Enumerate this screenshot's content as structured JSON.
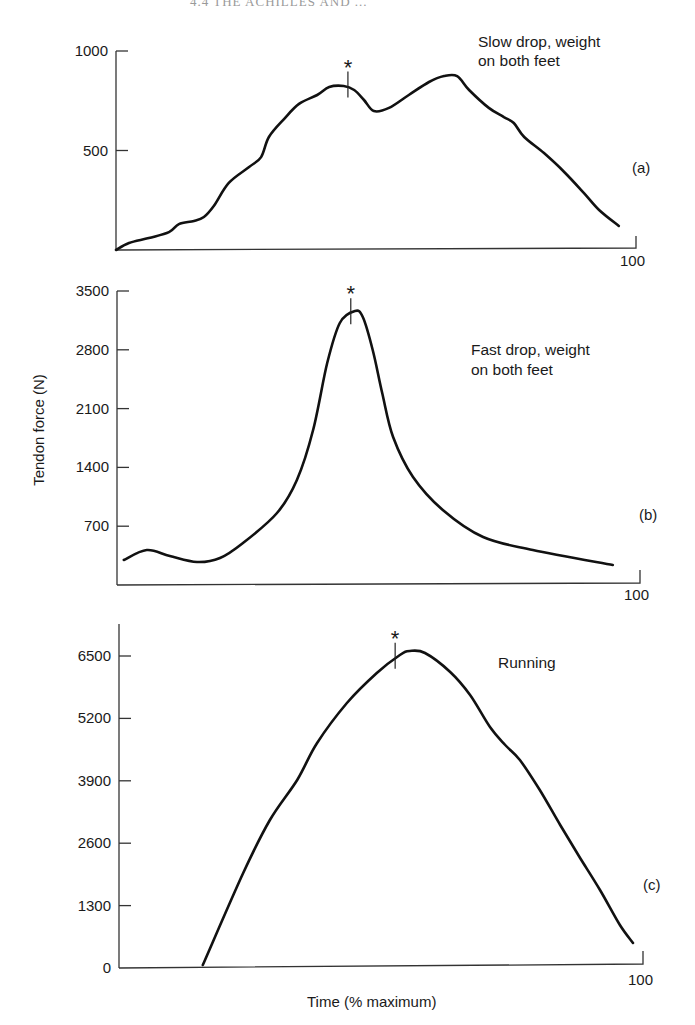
{
  "page_header": "4.4  THE ACHILLES AND ...",
  "chart_data": [
    {
      "id": "a",
      "type": "line",
      "panel_label": "(a)",
      "title_lines": [
        "Slow drop, weight",
        "on both feet"
      ],
      "xlabel": "Time (% maximum)",
      "ylabel": "Tendon force (N)",
      "xlim": [
        0,
        100
      ],
      "ylim": [
        0,
        1000
      ],
      "x_tick_labels": [
        "100"
      ],
      "y_ticks": [
        500,
        1000
      ],
      "y_tick_labels": [
        "500",
        "1000"
      ],
      "grid": false,
      "peak_marker": {
        "symbol": "*",
        "x": 44.6
      },
      "x": [
        0,
        2.5,
        6.3,
        10.2,
        12.1,
        15,
        16.9,
        18.8,
        21.7,
        25.6,
        27.9,
        29.4,
        32.3,
        35.2,
        38.7,
        41,
        43.8,
        45.8,
        47.7,
        49.6,
        52.5,
        56.3,
        60.2,
        63.1,
        65.6,
        67.9,
        71.7,
        74.6,
        76.5,
        78.5,
        82.3,
        86.2,
        90,
        92.9,
        96.7
      ],
      "values": [
        0,
        35,
        60,
        90,
        130,
        146,
        166,
        221,
        337,
        417,
        467,
        568,
        658,
        734,
        779,
        819,
        824,
        804,
        754,
        698,
        714,
        779,
        844,
        874,
        874,
        804,
        714,
        668,
        638,
        568,
        487,
        392,
        286,
        201,
        121
      ]
    },
    {
      "id": "b",
      "type": "line",
      "panel_label": "(b)",
      "title_lines": [
        "Fast drop, weight",
        "on both feet"
      ],
      "xlabel": "Time (% maximum)",
      "ylabel": "Tendon force (N)",
      "xlim": [
        0,
        100
      ],
      "ylim": [
        0,
        3500
      ],
      "x_tick_labels": [
        "100"
      ],
      "y_ticks": [
        700,
        1400,
        2100,
        2800,
        3500
      ],
      "y_tick_labels": [
        "700",
        "1400",
        "2100",
        "2800",
        "3500"
      ],
      "grid": false,
      "peak_marker": {
        "symbol": "*",
        "x": 44.7
      },
      "x": [
        1.3,
        5.7,
        10.1,
        15.3,
        19.7,
        24.1,
        30.6,
        34.4,
        37.5,
        40.2,
        42.6,
        45.5,
        47,
        48.9,
        50.7,
        52.8,
        56.6,
        62.3,
        70,
        79.5,
        94.8
      ],
      "values": [
        298,
        417,
        345,
        274,
        321,
        500,
        857,
        1250,
        1845,
        2643,
        3119,
        3262,
        3190,
        2798,
        2286,
        1762,
        1286,
        893,
        571,
        417,
        238
      ]
    },
    {
      "id": "c",
      "type": "line",
      "panel_label": "(c)",
      "title_lines": [
        "Running"
      ],
      "xlabel": "Time (% maximum)",
      "ylabel": "Tendon force (N)",
      "xlim": [
        0,
        100
      ],
      "ylim": [
        0,
        7100
      ],
      "x_tick_labels": [
        "100"
      ],
      "y_ticks": [
        0,
        1300,
        2600,
        3900,
        5200,
        6500
      ],
      "y_tick_labels": [
        "0",
        "1300",
        "2600",
        "3900",
        "5200",
        "6500"
      ],
      "grid": false,
      "peak_marker": {
        "symbol": "*",
        "x": 52.7
      },
      "x": [
        16,
        23.7,
        28.8,
        34,
        37.8,
        43.5,
        49.2,
        53.6,
        55.5,
        58.4,
        63.2,
        67,
        70.8,
        73.7,
        76.5,
        80.3,
        84.2,
        88,
        91.8,
        95.6,
        98.1
      ],
      "values": [
        63,
        1979,
        3083,
        3917,
        4688,
        5521,
        6146,
        6521,
        6604,
        6563,
        6167,
        5688,
        5021,
        4646,
        4333,
        3708,
        2979,
        2292,
        1625,
        896,
        521
      ]
    }
  ],
  "labels": {
    "ylabel": "Tendon force (N)",
    "xlabel": "Time (% maximum)"
  }
}
